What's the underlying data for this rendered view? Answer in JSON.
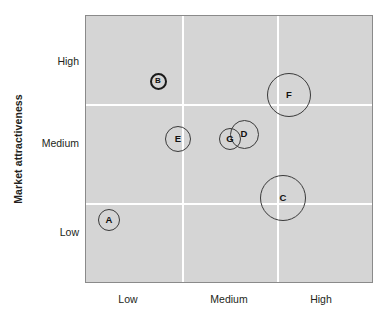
{
  "chart_data": {
    "type": "scatter",
    "title": "",
    "xlabel": "",
    "ylabel": "Market attractiveness",
    "x_categories": [
      "Low",
      "Medium",
      "High"
    ],
    "y_categories": [
      "Low",
      "Medium",
      "High"
    ],
    "grid": true,
    "legend": "none",
    "note": "Bubble / directional policy matrix. Bubble size encodes business strength or relative size.",
    "points": [
      {
        "label": "A",
        "x": "Low",
        "y": "Low",
        "x_val": 0.08,
        "y_val": 0.24,
        "size": 11,
        "marker": "thin"
      },
      {
        "label": "B",
        "x": "Low",
        "y": "High",
        "x_val": 0.25,
        "y_val": 0.76,
        "size": 8.5,
        "marker": "thick"
      },
      {
        "label": "C",
        "x": "High",
        "y": "Low-Medium",
        "x_val": 0.68,
        "y_val": 0.32,
        "size": 23,
        "marker": "thin"
      },
      {
        "label": "D",
        "x": "Medium",
        "y": "Medium-High",
        "x_val": 0.55,
        "y_val": 0.56,
        "size": 14,
        "marker": "thin"
      },
      {
        "label": "E",
        "x": "Low",
        "y": "Medium",
        "x_val": 0.32,
        "y_val": 0.54,
        "size": 13,
        "marker": "thin"
      },
      {
        "label": "F",
        "x": "High",
        "y": "High",
        "x_val": 0.7,
        "y_val": 0.71,
        "size": 22,
        "marker": "thin"
      },
      {
        "label": "G",
        "x": "Medium",
        "y": "Medium",
        "x_val": 0.5,
        "y_val": 0.53,
        "size": 11,
        "marker": "thin"
      }
    ]
  },
  "axes": {
    "y_title": "Market attractiveness",
    "y_ticks": [
      {
        "label": "High",
        "pos_px": 62
      },
      {
        "label": "Medium",
        "pos_px": 144
      },
      {
        "label": "Low",
        "pos_px": 233
      }
    ],
    "x_ticks": [
      {
        "label": "Low",
        "pos_px": 128
      },
      {
        "label": "Medium",
        "pos_px": 229
      },
      {
        "label": "High",
        "pos_px": 321
      }
    ]
  },
  "plot": {
    "left": 85,
    "top": 15,
    "width": 288,
    "height": 268,
    "background_color": "#d5d5d5",
    "border_color": "#8a8a8a",
    "gridline_color": "#ffffff",
    "gridlines_h_px": [
      88,
      187
    ],
    "gridlines_v_px": [
      96,
      191
    ]
  },
  "bubbles": [
    {
      "name": "A",
      "cx": 108,
      "cy": 219,
      "r": 11,
      "thick": false
    },
    {
      "name": "B",
      "cx": 157,
      "cy": 80,
      "r": 8.5,
      "thick": true
    },
    {
      "name": "C",
      "cx": 282,
      "cy": 197,
      "r": 23,
      "thick": false
    },
    {
      "name": "D",
      "cx": 243,
      "cy": 133,
      "r": 14.5,
      "thick": false
    },
    {
      "name": "E",
      "cx": 177,
      "cy": 138,
      "r": 13,
      "thick": false
    },
    {
      "name": "F",
      "cx": 288,
      "cy": 94,
      "r": 22,
      "thick": false
    },
    {
      "name": "G",
      "cx": 229,
      "cy": 138,
      "r": 11,
      "thick": false
    }
  ]
}
